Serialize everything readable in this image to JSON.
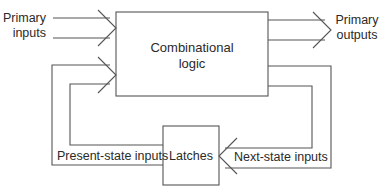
{
  "diagram": {
    "type": "block-diagram",
    "nodes": [
      {
        "id": "comb",
        "label_line1": "Combinational",
        "label_line2": "logic"
      },
      {
        "id": "latches",
        "label": "Latches"
      }
    ],
    "labels": {
      "primary_inputs_line1": "Primary",
      "primary_inputs_line2": "inputs",
      "primary_outputs_line1": "Primary",
      "primary_outputs_line2": "outputs",
      "present_state": "Present-state inputs",
      "next_state": "Next-state inputs"
    },
    "edges": [
      {
        "from": "Primary inputs",
        "to": "comb"
      },
      {
        "from": "comb",
        "to": "Primary outputs"
      },
      {
        "from": "comb",
        "to": "latches",
        "label": "Next-state inputs"
      },
      {
        "from": "latches",
        "to": "comb",
        "label": "Present-state inputs"
      }
    ],
    "colors": {
      "line": "#555555",
      "text": "#2a2a2a",
      "background": "#ffffff"
    }
  }
}
